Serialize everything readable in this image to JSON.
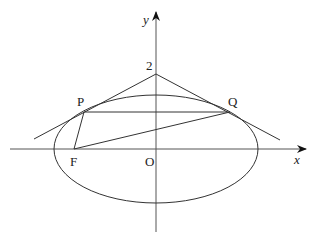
{
  "figure": {
    "type": "ellipse-tangent-geometry",
    "axes": {
      "x_label": "x",
      "y_label": "y",
      "origin_label": "O"
    },
    "labels": {
      "apex": "2",
      "P": "P",
      "Q": "Q",
      "F": "F"
    },
    "colors": {
      "stroke": "#333333",
      "axis": "#555555",
      "background": "#ffffff"
    }
  }
}
